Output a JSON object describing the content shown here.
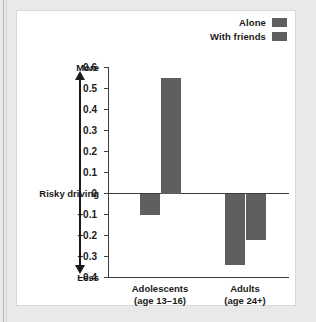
{
  "figure": {
    "axis_labels": {
      "more": "More",
      "less": "Less",
      "measure": "Risky driving"
    }
  },
  "chart_data": {
    "type": "bar",
    "title": "",
    "xlabel": "",
    "ylabel": "Risky driving",
    "ylim": [
      -0.4,
      0.6
    ],
    "yticks": [
      "0.6",
      "0.5",
      "0.4",
      "0.3",
      "0.2",
      "0.1",
      "0",
      "–0.1",
      "–0.2",
      "–0.3",
      "–0.4"
    ],
    "ytick_values": [
      0.6,
      0.5,
      0.4,
      0.3,
      0.2,
      0.1,
      0,
      -0.1,
      -0.2,
      -0.3,
      -0.4
    ],
    "grid": false,
    "legend_position": "top-right",
    "zero_line": true,
    "categories": [
      "Adolescents",
      "Adults"
    ],
    "category_sublabels": [
      "(age 13–16)",
      "(age 24+)"
    ],
    "series": [
      {
        "name": "Alone",
        "color": "#5f5f5f",
        "values": [
          -0.1,
          -0.34
        ]
      },
      {
        "name": "With friends",
        "color": "#5f5f5f",
        "values": [
          0.55,
          -0.22
        ]
      }
    ],
    "axis_annotations": {
      "top": "More",
      "zero": "Risky driving",
      "bottom": "Less"
    }
  }
}
